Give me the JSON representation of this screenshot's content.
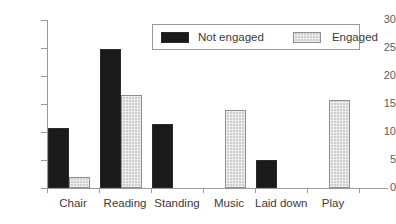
{
  "chart_data": {
    "type": "bar",
    "title": "",
    "xlabel": "",
    "ylabel": "",
    "ylim": [
      0,
      30
    ],
    "yticks": [
      0,
      5,
      10,
      15,
      20,
      25,
      30
    ],
    "grid": false,
    "legend_position": "top-center",
    "categories": [
      "Chair",
      "Reading",
      "Standing",
      "Music",
      "Laid down",
      "Play"
    ],
    "series": [
      {
        "name": "Not engaged",
        "color": "#1a1a1a",
        "values": [
          10.8,
          24.9,
          11.5,
          0,
          5.0,
          0
        ]
      },
      {
        "name": "Engaged",
        "color": "#cfcfcf",
        "values": [
          1.9,
          16.6,
          0,
          13.9,
          0,
          15.8
        ]
      }
    ]
  },
  "legend": {
    "entries": [
      {
        "label": "Not engaged",
        "swatch": "black-swatch"
      },
      {
        "label": "Engaged",
        "swatch": "gray-swatch"
      }
    ]
  },
  "axis": {
    "y_tick_labels": [
      "30",
      "25",
      "20",
      "15",
      "10",
      "5",
      "0"
    ]
  }
}
